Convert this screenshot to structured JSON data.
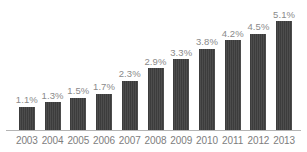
{
  "chart_data": {
    "type": "bar",
    "title": "",
    "subtitle": "",
    "xlabel": "",
    "ylabel": "",
    "grid": false,
    "legend": false,
    "legend_position": "none",
    "ylim": [
      0,
      5.1
    ],
    "value_suffix": "%",
    "categories": [
      "2003",
      "2004",
      "2005",
      "2006",
      "2007",
      "2008",
      "2009",
      "2010",
      "2011",
      "2012",
      "2013"
    ],
    "values": [
      1.1,
      1.3,
      1.5,
      1.7,
      2.3,
      2.9,
      3.3,
      3.8,
      4.2,
      4.5,
      5.1
    ],
    "data_labels": [
      "1.1%",
      "1.3%",
      "1.5%",
      "1.7%",
      "2.3%",
      "2.9%",
      "3.3%",
      "3.8%",
      "4.2%",
      "4.5%",
      "5.1%"
    ],
    "bar_color": "#3c3c3c",
    "label_color": "#8a8a8a",
    "axis_color": "#b4b4b4",
    "category_label_color": "#7d7d7d",
    "background_color": "#ffffff"
  }
}
